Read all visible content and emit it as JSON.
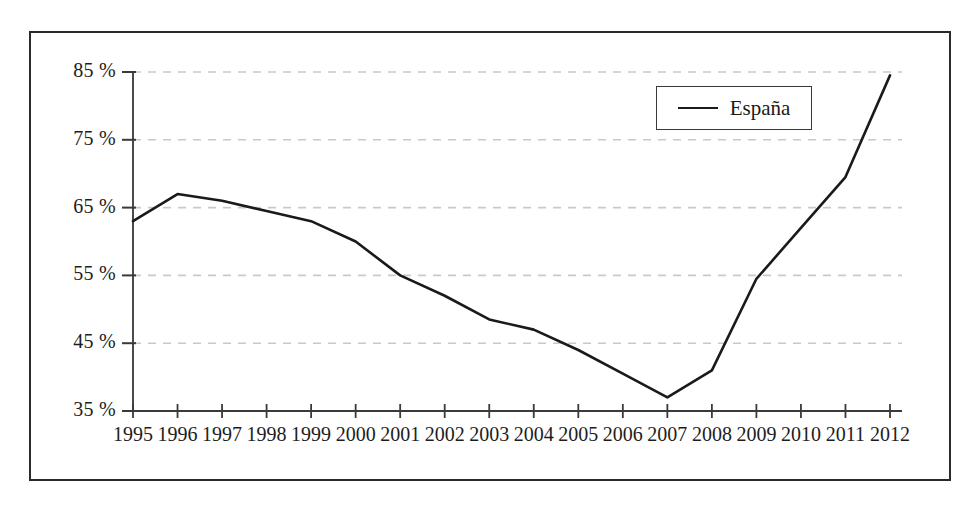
{
  "chart_data": {
    "type": "line",
    "title": "",
    "xlabel": "",
    "ylabel": "",
    "categories": [
      "1995",
      "1996",
      "1997",
      "1998",
      "1999",
      "2000",
      "2001",
      "2002",
      "2003",
      "2004",
      "2005",
      "2006",
      "2007",
      "2008",
      "2009",
      "2010",
      "2011",
      "2012"
    ],
    "series": [
      {
        "name": "España",
        "color": "#1a1a1a",
        "values": [
          63.0,
          67.0,
          66.0,
          64.5,
          63.0,
          60.0,
          55.0,
          52.0,
          48.5,
          47.0,
          44.0,
          40.5,
          37.0,
          41.0,
          54.5,
          62.0,
          69.5,
          84.5
        ]
      }
    ],
    "ytick_labels": [
      "85 %",
      "75 %",
      "65 %",
      "55 %",
      "45 %",
      "35 %"
    ],
    "ytick_values": [
      85,
      75,
      65,
      55,
      45,
      35
    ],
    "ylim": [
      35,
      85
    ],
    "xlim": [
      "1995",
      "2012"
    ],
    "grid": "horizontal-dashed",
    "grid_color": "#c9c9c9",
    "legend_position": "top-right",
    "legend_entries": [
      "España"
    ],
    "axis_color": "#3a3a3a",
    "frame_color": "#2b2b2b"
  },
  "legend": {
    "label": "España"
  }
}
